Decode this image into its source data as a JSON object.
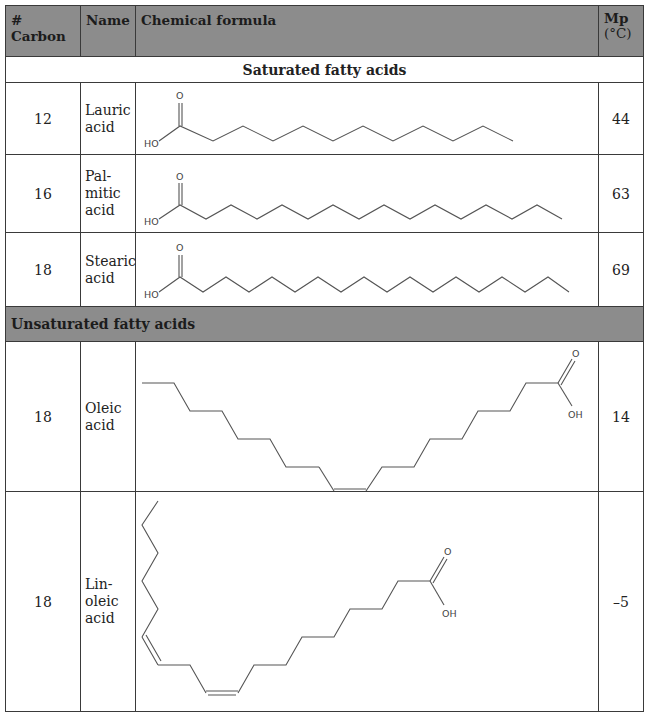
{
  "table": {
    "headers": {
      "carbon": "# Carbon",
      "name": "Name",
      "formula": "Chemical formula",
      "mp_line1": "Mp",
      "mp_line2": "(°C)"
    },
    "sections": [
      {
        "title": "Saturated fatty acids",
        "rows": [
          {
            "carbon": "12",
            "name_lines": [
              "Lauric",
              "acid"
            ],
            "mp": "44",
            "structure": "lauric-acid-skeletal"
          },
          {
            "carbon": "16",
            "name_lines": [
              "Pal-",
              "mitic",
              "acid"
            ],
            "mp": "63",
            "structure": "palmitic-acid-skeletal"
          },
          {
            "carbon": "18",
            "name_lines": [
              "Stearic",
              "acid"
            ],
            "mp": "69",
            "structure": "stearic-acid-skeletal"
          }
        ]
      },
      {
        "title": "Unsaturated fatty acids",
        "rows": [
          {
            "carbon": "18",
            "name_lines": [
              "Oleic",
              "acid"
            ],
            "mp": "14",
            "structure": "oleic-acid-skeletal"
          },
          {
            "carbon": "18",
            "name_lines": [
              "Lin-",
              "oleic",
              "acid"
            ],
            "mp": "–5",
            "structure": "linoleic-acid-skeletal"
          }
        ]
      }
    ],
    "atom_labels": {
      "oxygen": "O",
      "hydroxyl_left": "HO",
      "hydroxyl_right": "OH"
    }
  }
}
